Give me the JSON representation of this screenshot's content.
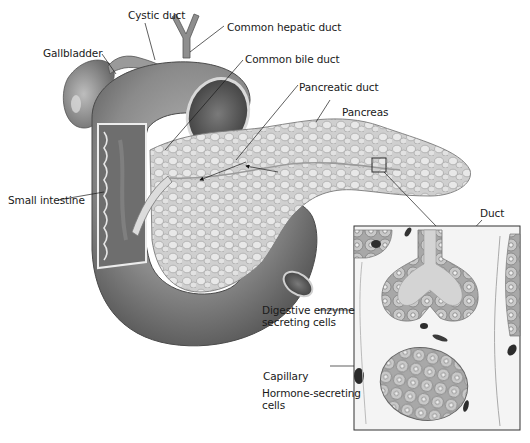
{
  "diagram": {
    "labels": {
      "cystic_duct": "Cystic duct",
      "common_hepatic_duct": "Common hepatic duct",
      "gallbladder": "Gallbladder",
      "common_bile_duct": "Common bile duct",
      "pancreatic_duct": "Pancreatic duct",
      "pancreas": "Pancreas",
      "small_intestine": "Small intestine",
      "duct": "Duct",
      "digestive_enzyme_line1": "Digestive enzyme",
      "digestive_enzyme_line2": "secreting cells",
      "capillary": "Capillary",
      "hormone_line1": "Hormone-secreting",
      "hormone_line2": "cells"
    },
    "colors": {
      "organ_dark": "#5a5a5a",
      "organ_mid": "#8c8c8c",
      "organ_light": "#c4c4c4",
      "pancreas_fill": "#d6d6d6",
      "cell_fill": "#bdbdbd",
      "background": "#ffffff",
      "line": "#1a1a1a"
    }
  }
}
